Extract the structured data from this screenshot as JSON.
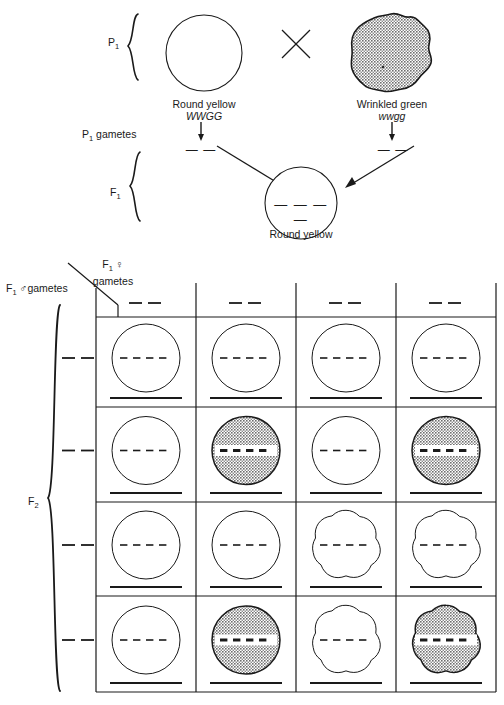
{
  "figure": {
    "ink_color": "#1a1a1a",
    "shade_color": "#9a9a9a",
    "background": "#ffffff"
  },
  "parental": {
    "generation_label": "P",
    "generation_sub": "1",
    "cross_symbol": "×",
    "parent_left": {
      "phenotype": "Round yellow",
      "genotype": "WWGG",
      "shape": "round",
      "shaded": false
    },
    "parent_right": {
      "phenotype": "Wrinkled green",
      "genotype": "wwgg",
      "shape": "wrinkled",
      "shaded": true
    },
    "gametes_label": "P",
    "gametes_label_sub": "1",
    "gametes_label_rest": " gametes",
    "gamete_left": "— —",
    "gamete_right": "— —"
  },
  "f1": {
    "generation_label": "F",
    "generation_sub": "1",
    "offspring": {
      "phenotype": "Round yellow",
      "genotype_blank": "— — — —",
      "shape": "round",
      "shaded": false
    }
  },
  "punnett": {
    "column_axis_label_main": "F",
    "column_axis_label_sub": "1",
    "column_axis_label_symbol": "♀",
    "column_axis_label_rest": "gametes",
    "row_axis_label_main": "F",
    "row_axis_label_sub": "1",
    "row_axis_label_symbol": "♂",
    "row_axis_label_rest": "gametes",
    "f2_label_main": "F",
    "f2_label_sub": "2",
    "column_headers": [
      "— —",
      "— —",
      "— —",
      "— —"
    ],
    "row_headers": [
      "— —",
      "— —",
      "— —",
      "— —"
    ],
    "cell_genotype_blank": "— — — —",
    "grid": [
      [
        {
          "shape": "round",
          "shaded": false
        },
        {
          "shape": "round",
          "shaded": false
        },
        {
          "shape": "round",
          "shaded": false
        },
        {
          "shape": "round",
          "shaded": false
        }
      ],
      [
        {
          "shape": "round",
          "shaded": false
        },
        {
          "shape": "round",
          "shaded": true
        },
        {
          "shape": "round",
          "shaded": false
        },
        {
          "shape": "round",
          "shaded": true
        }
      ],
      [
        {
          "shape": "round",
          "shaded": false
        },
        {
          "shape": "round",
          "shaded": false
        },
        {
          "shape": "wrinkled",
          "shaded": false
        },
        {
          "shape": "wrinkled",
          "shaded": false
        }
      ],
      [
        {
          "shape": "round",
          "shaded": false
        },
        {
          "shape": "round",
          "shaded": true
        },
        {
          "shape": "wrinkled",
          "shaded": false
        },
        {
          "shape": "wrinkled",
          "shaded": true
        }
      ]
    ]
  }
}
